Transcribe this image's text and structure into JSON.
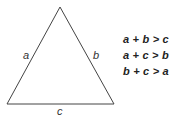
{
  "diagram": {
    "type": "triangle",
    "sides": {
      "left": "a",
      "right": "b",
      "bottom": "c"
    },
    "inequalities": [
      "a + b > c",
      "a + c > b",
      "b + c > a"
    ],
    "colors": {
      "stroke": "#333333",
      "text": "#222222",
      "background": "#ffffff"
    }
  }
}
